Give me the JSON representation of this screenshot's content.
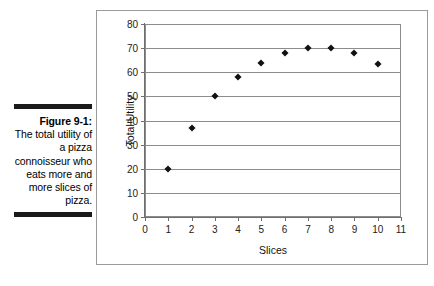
{
  "caption": {
    "label": "Figure 9-1:",
    "body": "The total utility of a pizza connoisseur who eats more and more slices of pizza.",
    "rule_color": "#1a1a1a"
  },
  "chart_data": {
    "type": "scatter",
    "title": "",
    "xlabel": "Slices",
    "ylabel": "Total Utility",
    "xlim": [
      0,
      11
    ],
    "ylim": [
      0,
      80
    ],
    "xticks": [
      0,
      1,
      2,
      3,
      4,
      5,
      6,
      7,
      8,
      9,
      10,
      11
    ],
    "yticks": [
      0,
      10,
      20,
      30,
      40,
      50,
      60,
      70,
      80
    ],
    "xtick_labels": [
      "0",
      "1",
      "2",
      "3",
      "4",
      "5",
      "6",
      "7",
      "8",
      "9",
      "10",
      "11"
    ],
    "ytick_labels": [
      "0",
      "10",
      "20",
      "30",
      "40",
      "50",
      "60",
      "70",
      "80"
    ],
    "grid": "horizontal",
    "legend": "none",
    "marker": "diamond",
    "marker_color": "#111111",
    "x": [
      1,
      2,
      3,
      4,
      5,
      6,
      7,
      8,
      9,
      10
    ],
    "values": [
      20,
      37,
      50,
      58,
      64,
      68,
      70,
      70,
      68,
      63.5
    ],
    "points": [
      {
        "x": 1,
        "y": 20
      },
      {
        "x": 2,
        "y": 37
      },
      {
        "x": 3,
        "y": 50
      },
      {
        "x": 4,
        "y": 58
      },
      {
        "x": 5,
        "y": 64
      },
      {
        "x": 6,
        "y": 68
      },
      {
        "x": 7,
        "y": 70
      },
      {
        "x": 8,
        "y": 70
      },
      {
        "x": 9,
        "y": 68
      },
      {
        "x": 10,
        "y": 63.5
      }
    ]
  },
  "colors": {
    "frame_border": "#9a9a9a",
    "axis": "#6e6e6e",
    "gridline": "#8c8c8c",
    "background": "#ffffff"
  }
}
